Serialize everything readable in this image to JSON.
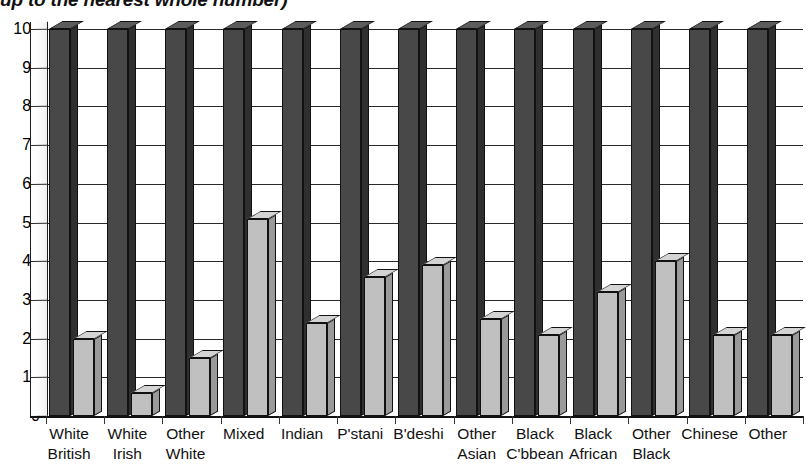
{
  "caption": {
    "text": "up to the nearest whole number)"
  },
  "chart_data": {
    "type": "bar",
    "title": "",
    "subtitle": "",
    "xlabel": "",
    "ylabel": "",
    "ylim": [
      0,
      100
    ],
    "yticks": [
      0,
      10,
      20,
      30,
      40,
      50,
      60,
      70,
      80,
      90,
      100
    ],
    "grid": true,
    "legend": "none",
    "style": "3d-clustered-column",
    "categories": [
      "White British",
      "White Irish",
      "Other White",
      "Mixed",
      "Indian",
      "P'stani",
      "B'deshi",
      "Other Asian",
      "Black C'bbean",
      "Black African",
      "Other Black",
      "Chinese",
      "Other"
    ],
    "category_lines": [
      [
        "White",
        "British"
      ],
      [
        "White",
        "Irish"
      ],
      [
        "Other",
        "White"
      ],
      [
        "Mixed",
        ""
      ],
      [
        "Indian",
        ""
      ],
      [
        "P'stani",
        ""
      ],
      [
        "B'deshi",
        ""
      ],
      [
        "Other",
        "Asian"
      ],
      [
        "Black",
        "C'bbean"
      ],
      [
        "Black",
        "African"
      ],
      [
        "Other",
        "Black"
      ],
      [
        "Chinese",
        ""
      ],
      [
        "Other",
        ""
      ]
    ],
    "series": [
      {
        "name": "Series 1",
        "color": "#484848",
        "values": [
          100,
          100,
          100,
          100,
          100,
          100,
          100,
          100,
          100,
          100,
          100,
          100,
          100
        ]
      },
      {
        "name": "Series 2",
        "color": "#c0c0c0",
        "values": [
          20,
          6,
          15,
          51,
          24,
          36,
          39,
          25,
          21,
          32,
          40,
          21,
          21
        ]
      }
    ]
  }
}
